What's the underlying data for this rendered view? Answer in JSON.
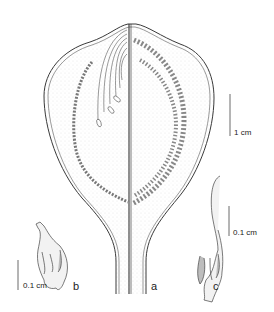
{
  "figure": {
    "panels": [
      {
        "id": "a",
        "label": "a",
        "description": "longitudinal section of fruit/capsule with coiled structures"
      },
      {
        "id": "b",
        "label": "b",
        "description": "detail structure"
      },
      {
        "id": "c",
        "label": "c",
        "description": "detail structure with elongated beak"
      }
    ],
    "scale_bars": {
      "main": "1 cm",
      "b": "0.1 cm",
      "c": "0.1 cm"
    }
  },
  "colors": {
    "line": "#3a3a3a",
    "stipple": "#d8d8d8",
    "shade": "#bdbdbd"
  }
}
